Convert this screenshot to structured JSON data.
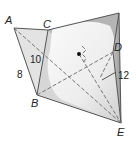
{
  "diagram": {
    "type": "geometry-figure",
    "vertices": {
      "A": "A",
      "B": "B",
      "C": "C",
      "D": "D",
      "E": "E"
    },
    "measurements": {
      "AB": "8",
      "CB": "10",
      "slant": "12"
    },
    "colors": {
      "face_light": "#e6e6e6",
      "face_mid": "#cfcfcf",
      "face_dark": "#a9a9a9",
      "cone": "#f2f2f2",
      "edge": "#555555",
      "dashed": "#777777"
    }
  }
}
